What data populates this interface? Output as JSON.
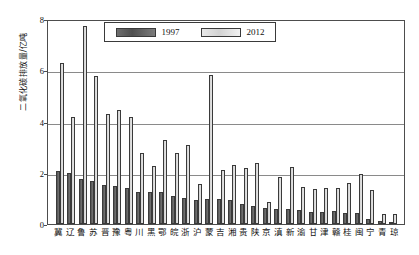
{
  "chart_data": {
    "type": "bar",
    "title": "",
    "xlabel": "",
    "ylabel": "二氧化碳排放量/亿吨",
    "ylim": [
      0,
      8
    ],
    "yticks": [
      0,
      2,
      4,
      6,
      8
    ],
    "grid": true,
    "legend_position": "top-center",
    "categories": [
      "冀",
      "辽",
      "鲁",
      "苏",
      "晋",
      "豫",
      "粤",
      "川",
      "黑",
      "鄂",
      "皖",
      "浙",
      "沪",
      "蒙",
      "吉",
      "湘",
      "贵",
      "陕",
      "京",
      "滇",
      "新",
      "渝",
      "甘",
      "津",
      "赣",
      "桂",
      "闽",
      "宁",
      "青",
      "琼"
    ],
    "series": [
      {
        "name": "1997",
        "color": "#555555",
        "values": [
          2.05,
          1.99,
          1.76,
          1.68,
          1.51,
          1.48,
          1.4,
          1.26,
          1.25,
          1.23,
          1.09,
          1.01,
          0.95,
          0.96,
          0.96,
          0.92,
          0.77,
          0.71,
          0.62,
          0.6,
          0.6,
          0.56,
          0.48,
          0.48,
          0.49,
          0.44,
          0.42,
          0.21,
          0.13,
          0.09
        ]
      },
      {
        "name": "2012",
        "color": "#d8d8d8",
        "values": [
          6.27,
          4.17,
          7.72,
          5.76,
          4.28,
          4.44,
          4.19,
          2.78,
          2.28,
          3.26,
          2.77,
          3.08,
          1.55,
          5.82,
          2.12,
          2.31,
          2.17,
          2.39,
          0.85,
          1.85,
          2.23,
          1.45,
          1.38,
          1.42,
          1.41,
          1.59,
          1.96,
          1.32,
          0.4,
          0.38
        ]
      }
    ]
  },
  "legend": {
    "entries": [
      {
        "label": "1997",
        "swatch": "dark-gray-swatch"
      },
      {
        "label": "2012",
        "swatch": "light-gray-swatch"
      }
    ]
  },
  "axis": {
    "y_tick_labels": [
      "8",
      "6",
      "4",
      "2",
      "0"
    ],
    "y_title": "二氧化碳排放量/亿吨"
  }
}
